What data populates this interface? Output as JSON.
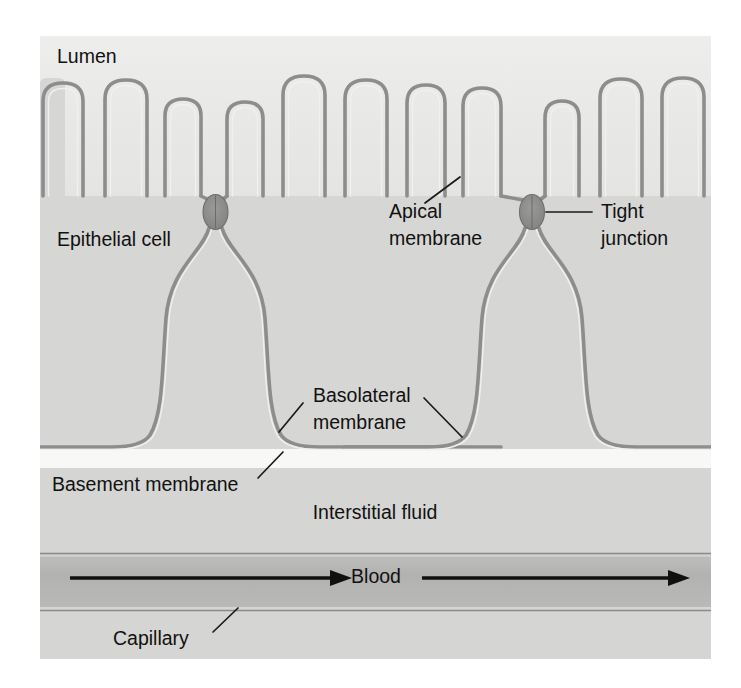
{
  "figure": {
    "type": "biology-diagram",
    "background_color": "#ffffff",
    "panel_color": "#d9d9d9"
  },
  "labels": {
    "lumen": "Lumen",
    "epithelial_cell": "Epithelial cell",
    "apical_membrane_line1": "Apical",
    "apical_membrane_line2": "membrane",
    "tight_junction_line1": "Tight",
    "tight_junction_line2": "junction",
    "basolateral_membrane_line1": "Basolateral",
    "basolateral_membrane_line2": "membrane",
    "basement_membrane": "Basement membrane",
    "interstitial_fluid": "Interstitial fluid",
    "blood": "Blood",
    "capillary": "Capillary"
  },
  "regions": [
    {
      "name": "lumen",
      "fill": "#e9e9e7",
      "y_top": 36,
      "y_bottom": 196
    },
    {
      "name": "epithelial-cell-layer",
      "fill": "#d6d6d4",
      "y_top": 196,
      "y_bottom": 447
    },
    {
      "name": "basement-membrane",
      "fill": "#f7f7f6",
      "y_top": 449,
      "y_bottom": 468
    },
    {
      "name": "interstitial-fluid",
      "fill": "#d4d4d2",
      "y_top": 468,
      "y_bottom": 551
    },
    {
      "name": "capillary-lumen",
      "fill": "#b4b4b2",
      "y_top": 556,
      "y_bottom": 606
    },
    {
      "name": "capillary-wall-lower",
      "fill": "#d4d4d2",
      "y_top": 606,
      "y_bottom": 659
    }
  ],
  "structures": {
    "microvilli_count": 13,
    "tight_junction_count": 2,
    "tight_junction_fill": "#8f8f8f",
    "membrane_stroke": "#8d8d8d",
    "cell_boundaries_x": [
      216,
      532
    ],
    "blood_flow_direction": "left-to-right",
    "blood_arrow_count": 2
  },
  "panel": {
    "x": 40,
    "y": 36,
    "width": 671,
    "height": 623
  }
}
